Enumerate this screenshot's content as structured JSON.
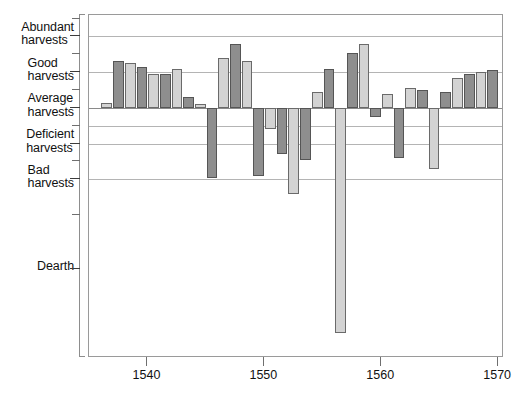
{
  "chart_data": {
    "type": "bar",
    "title": "",
    "xlabel": "",
    "ylabel": "",
    "grid": true,
    "legend": false,
    "xlim": [
      1535.0,
      1570.5
    ],
    "ylim": [
      -7.0,
      2.6
    ],
    "xticks": [
      1540,
      1550,
      1560,
      1570
    ],
    "xticklabels": [
      "1540",
      "1550",
      "1560",
      "1570"
    ],
    "yticklabels": [
      "Abundant\nharvests",
      "Good\nharvests",
      "Average\nharvests",
      "Deficient\nharvests",
      "Bad\nharvests",
      "Dearth"
    ],
    "ytickvalues": [
      2.0,
      1.0,
      0.0,
      -1.0,
      -2.0,
      -4.5
    ],
    "gridline_values": [
      2.0,
      1.0,
      0.0,
      -0.5,
      -1.0,
      -2.0
    ],
    "bar_color_light": "#d3d3d3",
    "bar_color_dark": "#8e8e8e",
    "x": [
      1536,
      1537,
      1538,
      1539,
      1540,
      1541,
      1542,
      1543,
      1544,
      1545,
      1546,
      1547,
      1548,
      1549,
      1550,
      1551,
      1552,
      1553,
      1554,
      1555,
      1556,
      1557,
      1558,
      1559,
      1560,
      1561,
      1562,
      1563,
      1564,
      1565,
      1566,
      1567,
      1568,
      1569
    ],
    "values": [
      0.15,
      1.3,
      1.25,
      1.15,
      0.95,
      0.95,
      1.1,
      0.3,
      0.1,
      -1.95,
      1.4,
      1.8,
      1.3,
      -1.9,
      -0.6,
      -1.3,
      -2.4,
      -1.45,
      0.45,
      1.1,
      -6.3,
      1.55,
      1.8,
      -0.25,
      0.4,
      -1.4,
      0.55,
      0.5,
      -1.7,
      0.45,
      0.85,
      0.95,
      1.0,
      1.05
    ],
    "series_name": "Harvest quality index"
  }
}
